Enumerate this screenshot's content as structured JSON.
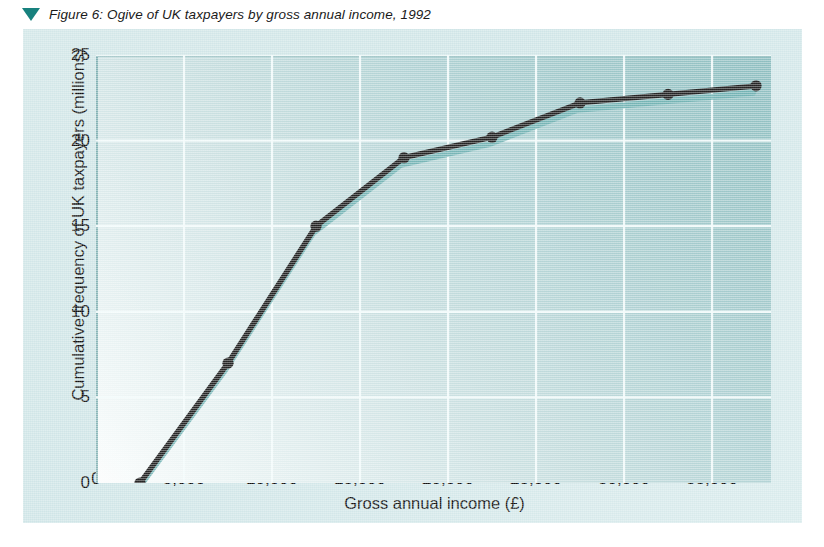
{
  "caption": {
    "marker_icon": "triangle-down-icon",
    "text": "Figure 6: Ogive of UK taxpayers by gross annual income, 1992",
    "marker_color": "#18817e"
  },
  "colors": {
    "page_background": "#ffffff",
    "panel_background": "#d3e7e8",
    "plot_dark_teal": "#7fb6b8",
    "plot_light": "#fbfdfd",
    "gridline": "#f2fbfb",
    "series_line": "#0b0b0b",
    "series_shadow": "#5fa8aa",
    "axis_text": "#111111"
  },
  "chart_data": {
    "type": "line",
    "title": "Figure 6: Ogive of UK taxpayers by gross annual income, 1992",
    "subtitle": "",
    "xlabel": "Gross annual income (£)",
    "ylabel": "Cumulative frequency of UK taxpayers (millions)",
    "xlim": [
      0,
      38350
    ],
    "ylim": [
      0,
      25
    ],
    "xticks": [
      0,
      5000,
      10000,
      15000,
      20000,
      25000,
      30000,
      35000
    ],
    "xtick_labels": [
      "0",
      "5,000",
      "10,000",
      "15,000",
      "20,000",
      "25,000",
      "30,000",
      "35,000"
    ],
    "yticks": [
      0,
      5,
      10,
      15,
      20,
      25
    ],
    "ytick_labels": [
      "0",
      "5",
      "10",
      "15",
      "20",
      "25"
    ],
    "grid": true,
    "legend": false,
    "legend_position": "none",
    "marker": "filled-circle",
    "x": [
      2500,
      7500,
      12500,
      17500,
      22500,
      27500,
      32500,
      37500
    ],
    "values": [
      0.0,
      7.0,
      15.0,
      19.0,
      20.2,
      22.2,
      22.7,
      23.2
    ],
    "series": [
      {
        "name": "Cumulative frequency of UK taxpayers",
        "x": [
          2500,
          7500,
          12500,
          17500,
          22500,
          27500,
          32500,
          37500
        ],
        "values": [
          0.0,
          7.0,
          15.0,
          19.0,
          20.2,
          22.2,
          22.7,
          23.2
        ]
      }
    ],
    "annotations": []
  }
}
